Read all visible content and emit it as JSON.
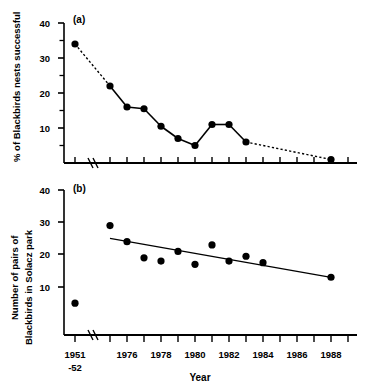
{
  "figure": {
    "xlabel": "Year",
    "panels": [
      {
        "tag": "(a)",
        "ylabel": "% of Blackbirds nests successful",
        "ylim": [
          0,
          42
        ],
        "yticks": [
          10,
          20,
          30,
          40
        ],
        "ytick_labels": [
          "10",
          "20",
          "30",
          "40"
        ]
      },
      {
        "tag": "(b)",
        "ylabel_line1": "Number of pairs of",
        "ylabel_line2": "Blackbirds in Solacz park",
        "ylim": [
          0,
          42
        ],
        "yticks": [
          10,
          20,
          30,
          40
        ],
        "ytick_labels": [
          "10",
          "20",
          "30",
          "40"
        ]
      }
    ],
    "xtick_labels": [
      "1951",
      "-52",
      "1976",
      "1978",
      "1980",
      "1982",
      "1984",
      "1986",
      "1988"
    ]
  },
  "chart_data": [
    {
      "type": "line",
      "title": "(a)",
      "xlabel": "Year",
      "ylabel": "% of Blackbirds nests successful",
      "ylim": [
        0,
        42
      ],
      "yticks": [
        10,
        20,
        30,
        40
      ],
      "grid": false,
      "legend": "none",
      "x": [
        "1951-52",
        1975,
        1976,
        1977,
        1978,
        1979,
        1980,
        1981,
        1982,
        1983,
        1988
      ],
      "values": [
        34,
        22,
        16,
        15.5,
        10.5,
        7,
        5,
        11,
        11,
        6,
        1
      ],
      "segment_styles": [
        "dotted",
        "solid",
        "solid",
        "solid",
        "solid",
        "solid",
        "solid",
        "solid",
        "solid",
        "dotted"
      ],
      "marker": "filled-circle"
    },
    {
      "type": "scatter",
      "title": "(b)",
      "xlabel": "Year",
      "ylabel": "Number of pairs of Blackbirds in Solacz park",
      "ylim": [
        0,
        42
      ],
      "yticks": [
        10,
        20,
        30,
        40
      ],
      "grid": false,
      "legend": "none",
      "x": [
        "1951-52",
        1975,
        1976,
        1977,
        1978,
        1979,
        1980,
        1981,
        1982,
        1983,
        1984,
        1988
      ],
      "values": [
        5,
        29,
        24,
        19,
        18,
        21,
        17,
        23,
        18,
        19.5,
        17.5,
        13
      ],
      "marker": "filled-circle",
      "trendline": {
        "x_start": 1975,
        "y_start": 25,
        "x_end": 1988,
        "y_end": 13,
        "style": "solid"
      }
    }
  ]
}
